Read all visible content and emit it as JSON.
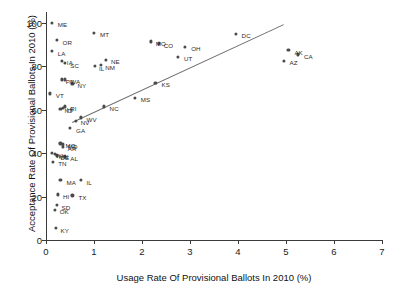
{
  "chart_data": {
    "type": "scatter",
    "title": "",
    "xlabel": "Usage Rate Of Provisional Ballots In 2010 (%)",
    "ylabel": "Acceptance Rate Of Provisional Ballots In 2010 (%)",
    "xlim": [
      0,
      7
    ],
    "ylim": [
      0,
      105
    ],
    "xticks": [
      0,
      1,
      2,
      3,
      4,
      5,
      6,
      7
    ],
    "yticks": [
      0,
      20,
      40,
      60,
      80,
      100
    ],
    "grid": false,
    "legend": null,
    "point_color": "#4a4a4a",
    "trendline_color": "#6e6e6e",
    "trendline": {
      "x_start": 0.55,
      "y_start": 54.5,
      "x_end": 4.95,
      "y_end": 99.5
    },
    "points": [
      {
        "label": "ME",
        "x": 0.12,
        "y": 100.0
      },
      {
        "label": "MT",
        "x": 1.0,
        "y": 95.5
      },
      {
        "label": "OR",
        "x": 0.22,
        "y": 92.0
      },
      {
        "label": "MO",
        "x": 2.18,
        "y": 91.5
      },
      {
        "label": "CO",
        "x": 2.35,
        "y": 90.5
      },
      {
        "label": "OH",
        "x": 2.9,
        "y": 89.0
      },
      {
        "label": "LA",
        "x": 0.12,
        "y": 87.0
      },
      {
        "label": "DC",
        "x": 3.95,
        "y": 95.0
      },
      {
        "label": "AK",
        "x": 5.05,
        "y": 87.5
      },
      {
        "label": "CA",
        "x": 5.25,
        "y": 85.5
      },
      {
        "label": "AZ",
        "x": 4.95,
        "y": 82.5
      },
      {
        "label": "IA",
        "x": 0.33,
        "y": 82.5
      },
      {
        "label": "SC",
        "x": 0.4,
        "y": 81.5
      },
      {
        "label": "NE",
        "x": 1.25,
        "y": 83.0
      },
      {
        "label": "NM",
        "x": 1.15,
        "y": 80.5
      },
      {
        "label": "IL",
        "x": 1.02,
        "y": 80.0
      },
      {
        "label": "UT",
        "x": 2.75,
        "y": 84.5
      },
      {
        "label": "WA",
        "x": 0.4,
        "y": 74.0
      },
      {
        "label": "PA",
        "x": 0.33,
        "y": 74.0
      },
      {
        "label": "NY",
        "x": 0.55,
        "y": 72.0
      },
      {
        "label": "KS",
        "x": 2.28,
        "y": 72.5
      },
      {
        "label": "VT",
        "x": 0.08,
        "y": 67.5
      },
      {
        "label": "MS",
        "x": 1.85,
        "y": 65.5
      },
      {
        "label": "RI",
        "x": 0.4,
        "y": 61.5
      },
      {
        "label": "HI",
        "x": 0.35,
        "y": 61.0
      },
      {
        "label": "NJ",
        "x": 0.3,
        "y": 60.5
      },
      {
        "label": "NC",
        "x": 1.2,
        "y": 61.5
      },
      {
        "label": "WV",
        "x": 0.72,
        "y": 56.5
      },
      {
        "label": "NV",
        "x": 0.62,
        "y": 55.0
      },
      {
        "label": "GA",
        "x": 0.5,
        "y": 51.5
      },
      {
        "label": "MO2",
        "x": 0.3,
        "y": 44.5
      },
      {
        "label": "MD",
        "x": 0.35,
        "y": 44.0
      },
      {
        "label": "AR",
        "x": 0.35,
        "y": 43.0
      },
      {
        "label": "WI",
        "x": 0.12,
        "y": 40.0
      },
      {
        "label": "MN",
        "x": 0.18,
        "y": 39.5
      },
      {
        "label": "DE",
        "x": 0.22,
        "y": 39.0
      },
      {
        "label": "AL",
        "x": 0.4,
        "y": 38.5
      },
      {
        "label": "TN",
        "x": 0.15,
        "y": 36.0
      },
      {
        "label": "MA",
        "x": 0.3,
        "y": 27.5
      },
      {
        "label": "IL2",
        "x": 0.72,
        "y": 27.5
      },
      {
        "label": "HI2",
        "x": 0.25,
        "y": 21.0
      },
      {
        "label": "TX",
        "x": 0.55,
        "y": 20.5
      },
      {
        "label": "SD",
        "x": 0.22,
        "y": 16.0
      },
      {
        "label": "OK",
        "x": 0.18,
        "y": 14.0
      },
      {
        "label": "KY",
        "x": 0.2,
        "y": 5.5
      }
    ],
    "point_labels": [
      {
        "text": "ME",
        "x": 0.12,
        "y": 100.0,
        "dx": 6,
        "dy": 0
      },
      {
        "text": "MT",
        "x": 1.0,
        "y": 95.5,
        "dx": 6,
        "dy": 0
      },
      {
        "text": "OR",
        "x": 0.22,
        "y": 92.0,
        "dx": 6,
        "dy": 0
      },
      {
        "text": "MO",
        "x": 2.18,
        "y": 91.5,
        "dx": 5,
        "dy": 0
      },
      {
        "text": "CO",
        "x": 2.35,
        "y": 90.5,
        "dx": 5,
        "dy": 0
      },
      {
        "text": "OH",
        "x": 2.9,
        "y": 89.0,
        "dx": 6,
        "dy": 0
      },
      {
        "text": "LA",
        "x": 0.12,
        "y": 87.0,
        "dx": 6,
        "dy": 0
      },
      {
        "text": "DC",
        "x": 3.95,
        "y": 95.0,
        "dx": 6,
        "dy": 0
      },
      {
        "text": "AK",
        "x": 5.05,
        "y": 87.5,
        "dx": 6,
        "dy": 0
      },
      {
        "text": "CA",
        "x": 5.25,
        "y": 85.5,
        "dx": 6,
        "dy": 0
      },
      {
        "text": "AZ",
        "x": 4.95,
        "y": 82.5,
        "dx": 6,
        "dy": 0
      },
      {
        "text": "IA",
        "x": 0.33,
        "y": 82.5,
        "dx": 5,
        "dy": 0
      },
      {
        "text": "SC",
        "x": 0.4,
        "y": 81.5,
        "dx": 5,
        "dy": 0
      },
      {
        "text": "NE",
        "x": 1.25,
        "y": 83.0,
        "dx": 5,
        "dy": 0
      },
      {
        "text": "NM",
        "x": 1.15,
        "y": 80.5,
        "dx": 4,
        "dy": 0
      },
      {
        "text": "IL",
        "x": 1.02,
        "y": 80.0,
        "dx": 4,
        "dy": 0
      },
      {
        "text": "UT",
        "x": 2.75,
        "y": 84.5,
        "dx": 6,
        "dy": 0
      },
      {
        "text": "WA",
        "x": 0.4,
        "y": 74.0,
        "dx": 5,
        "dy": 0
      },
      {
        "text": "PA",
        "x": 0.33,
        "y": 74.0,
        "dx": 4,
        "dy": 0
      },
      {
        "text": "NY",
        "x": 0.55,
        "y": 72.0,
        "dx": 5,
        "dy": 0
      },
      {
        "text": "KS",
        "x": 2.28,
        "y": 72.5,
        "dx": 6,
        "dy": 0
      },
      {
        "text": "VT",
        "x": 0.08,
        "y": 67.5,
        "dx": 6,
        "dy": 0
      },
      {
        "text": "MS",
        "x": 1.85,
        "y": 65.5,
        "dx": 6,
        "dy": 0
      },
      {
        "text": "RI",
        "x": 0.4,
        "y": 61.5,
        "dx": 5,
        "dy": 0
      },
      {
        "text": "HI",
        "x": 0.35,
        "y": 61.0,
        "dx": 4,
        "dy": 0
      },
      {
        "text": "NJ",
        "x": 0.3,
        "y": 60.5,
        "dx": 4,
        "dy": 0
      },
      {
        "text": "NC",
        "x": 1.2,
        "y": 61.5,
        "dx": 6,
        "dy": 0
      },
      {
        "text": "WV",
        "x": 0.72,
        "y": 56.5,
        "dx": 6,
        "dy": 0
      },
      {
        "text": "NV",
        "x": 0.62,
        "y": 55.0,
        "dx": 5,
        "dy": 0
      },
      {
        "text": "GA",
        "x": 0.5,
        "y": 51.5,
        "dx": 6,
        "dy": 0
      },
      {
        "text": "MO",
        "x": 0.3,
        "y": 44.5,
        "dx": 5,
        "dy": 0
      },
      {
        "text": "MD",
        "x": 0.35,
        "y": 44.0,
        "dx": 5,
        "dy": 0
      },
      {
        "text": "AR",
        "x": 0.35,
        "y": 43.0,
        "dx": 5,
        "dy": 0
      },
      {
        "text": "WI",
        "x": 0.12,
        "y": 40.0,
        "dx": 4,
        "dy": 0
      },
      {
        "text": "MN",
        "x": 0.18,
        "y": 39.5,
        "dx": 4,
        "dy": 0
      },
      {
        "text": "DE",
        "x": 0.22,
        "y": 39.0,
        "dx": 4,
        "dy": 0
      },
      {
        "text": "AL",
        "x": 0.4,
        "y": 38.5,
        "dx": 5,
        "dy": 0
      },
      {
        "text": "TN",
        "x": 0.15,
        "y": 36.0,
        "dx": 5,
        "dy": 0
      },
      {
        "text": "MA",
        "x": 0.3,
        "y": 27.5,
        "dx": 6,
        "dy": 0
      },
      {
        "text": "IL",
        "x": 0.72,
        "y": 27.5,
        "dx": 6,
        "dy": 0
      },
      {
        "text": "HI",
        "x": 0.25,
        "y": 21.0,
        "dx": 5,
        "dy": 0
      },
      {
        "text": "TX",
        "x": 0.55,
        "y": 20.5,
        "dx": 6,
        "dy": 0
      },
      {
        "text": "SD",
        "x": 0.22,
        "y": 16.0,
        "dx": 5,
        "dy": 0
      },
      {
        "text": "OK",
        "x": 0.18,
        "y": 14.0,
        "dx": 5,
        "dy": 0
      },
      {
        "text": "KY",
        "x": 0.2,
        "y": 5.5,
        "dx": 5,
        "dy": 0
      }
    ]
  }
}
